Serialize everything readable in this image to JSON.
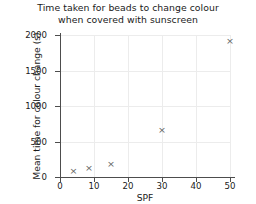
{
  "chart_data": {
    "type": "scatter",
    "title": "Time taken for beads to change colour when covered with sunscreen",
    "title_line1": "Time taken for beads to change colour",
    "title_line2": "when covered with sunscreen",
    "xlabel": "SPF",
    "ylabel": "Mean time for colour change (s)",
    "xlim": [
      0,
      53
    ],
    "ylim": [
      0,
      2060
    ],
    "xticks": [
      0,
      10,
      20,
      30,
      40,
      50
    ],
    "yticks": [
      0,
      500,
      1000,
      1500,
      2000
    ],
    "xtick_labels": [
      "0",
      "10",
      "20",
      "30",
      "40",
      "50"
    ],
    "ytick_labels": [
      "0",
      "500",
      "1000",
      "1500",
      "2000"
    ],
    "grid": true,
    "legend": false,
    "marker": "x",
    "marker_color": "#636363",
    "axis_color": "#4d4d4d",
    "grid_color": "#ececec",
    "background": "#ffffff",
    "x": [
      4,
      8.5,
      15,
      30,
      50
    ],
    "y": [
      85,
      130,
      190,
      665,
      1920
    ],
    "points": [
      {
        "x": 4,
        "y": 85
      },
      {
        "x": 8.5,
        "y": 130
      },
      {
        "x": 15,
        "y": 190
      },
      {
        "x": 30,
        "y": 665
      },
      {
        "x": 50,
        "y": 1920
      }
    ]
  }
}
